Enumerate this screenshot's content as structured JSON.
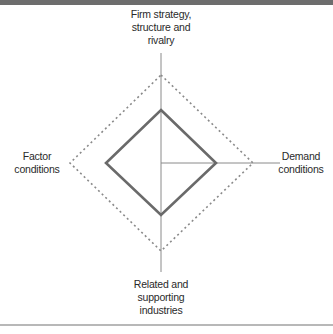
{
  "diagram": {
    "nodes": {
      "top": {
        "lines": [
          "Firm strategy,",
          "structure and",
          "rivalry"
        ]
      },
      "right": {
        "lines": [
          "Demand",
          "conditions"
        ]
      },
      "bottom": {
        "lines": [
          "Related and",
          "supporting",
          "industries"
        ]
      },
      "left": {
        "lines": [
          "Factor",
          "conditions"
        ]
      }
    },
    "colors": {
      "inner_diamond": "#6a6a6a",
      "outer_dashed": "#8a8a8a",
      "axes": "#8a8a8a",
      "top_bar": "#6d6d6d",
      "bottom_rule": "#b8b8b8"
    }
  }
}
